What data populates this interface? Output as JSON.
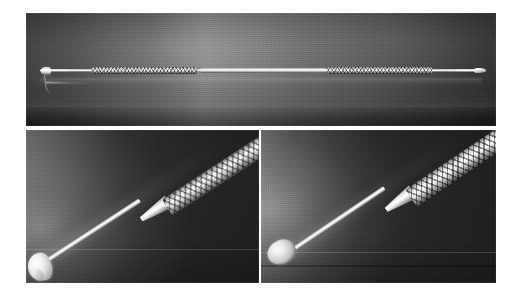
{
  "plate": {
    "title": "Double-ended dental instrument — three-view product plate",
    "background_color": "#ffffff",
    "width": 516,
    "height": 298,
    "panel_count": 3,
    "layout": "one full-width view on top, two close-up views below"
  },
  "palette": {
    "backdrop_dark": "#232323",
    "backdrop_mid": "#3a3a3a",
    "backdrop_light": "#6a6a6a",
    "metal_highlight": "#ffffff",
    "metal_mid": "#cbcbc9",
    "metal_shadow": "#4e4e4e",
    "plate_background": "#ffffff",
    "gutter": "#ffffff"
  },
  "panels": [
    {
      "id": "top",
      "name": "full-instrument-view",
      "description": "Full length side view of the double-ended instrument lying horizontally on a dark reflective surface",
      "orientation": "horizontal",
      "subject": "double-ended dental instrument",
      "left_tip": "flat round condenser / plugger disc",
      "right_tip": "small spoon excavator blade",
      "handle_style": "two diamond-knurled grip sections with a smooth polished centre body",
      "backdrop": "dark graduated studio backdrop, bloom left of centre"
    },
    {
      "id": "bottom-left",
      "name": "plugger-tip-closeup",
      "description": "Angled close-up of the flat disc condenser end, shaft running from lower-left to upper-right",
      "orientation": "diagonal",
      "subject": "condenser / plugger working end",
      "tip_shape": "flat circular disc set at right angles to the shaft",
      "handle_style": "diamond-knurled grip with tapered smooth ferrule",
      "backdrop": "dark graduated studio backdrop, bloom at left edge"
    },
    {
      "id": "bottom-right",
      "name": "spoon-tip-closeup",
      "description": "Angled close-up of the spoon / spatula working end, shaft running from lower-left to upper-right",
      "orientation": "diagonal",
      "subject": "spoon excavator working end",
      "tip_shape": "oval concave spoon blade",
      "handle_style": "diamond-knurled grip with tapered smooth ferrule",
      "backdrop": "dark graduated studio backdrop, bloom at left edge"
    }
  ]
}
